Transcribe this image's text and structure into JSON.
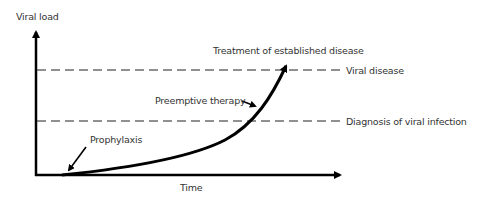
{
  "diagram": {
    "y_axis_label": "Viral load",
    "x_axis_label": "Time",
    "thresholds": [
      {
        "label": "Viral disease"
      },
      {
        "label": "Diagnosis of viral infection"
      }
    ],
    "annotations": {
      "treatment": "Treatment of established disease",
      "preemptive": "Preemptive therapy",
      "prophylaxis": "Prophylaxis"
    },
    "colors": {
      "line": "#000000",
      "dash": "#222222",
      "text": "#333333"
    }
  }
}
